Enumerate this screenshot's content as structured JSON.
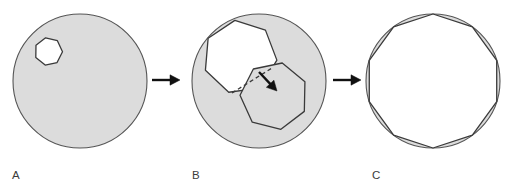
{
  "figure": {
    "background_color": "#ffffff",
    "width": 511,
    "height": 186
  },
  "style": {
    "gray_fill": "#dcdcdc",
    "white_fill": "#ffffff",
    "outline_color": "#555555",
    "polygon_outline_color": "#3a3a3a",
    "arrow_color": "#111111",
    "label_color": "#3b3b3b",
    "dash_color": "#3a3a3a",
    "outline_width": 1.1,
    "polygon_outline_width": 1.3
  },
  "panels": [
    {
      "id": "panel-a",
      "label": "A",
      "label_x": 12,
      "label_y": 179,
      "circle": {
        "cx": 80,
        "cy": 81,
        "r": 67,
        "fill": "#dcdcdc",
        "stroke": "#555555"
      },
      "shapes": [
        {
          "name": "seed-heptagon",
          "kind": "polygon",
          "sides": 7,
          "cx": 48.5,
          "cy": 51.5,
          "r": 14,
          "rotation_deg": -12,
          "fill": "#ffffff",
          "stroke": "#3a3a3a"
        }
      ],
      "arrow_after": {
        "name": "arrow-a-to-b",
        "x1": 152,
        "y1": 80,
        "x2": 180,
        "y2": 80
      }
    },
    {
      "id": "panel-b",
      "label": "B",
      "label_x": 192,
      "label_y": 179,
      "circle": {
        "cx": 259,
        "cy": 81,
        "r": 67,
        "fill": "#dcdcdc",
        "stroke": "#555555"
      },
      "shapes": [
        {
          "name": "grown-heptagon-white",
          "kind": "polygon",
          "sides": 7,
          "cx": 240,
          "cy": 57,
          "r": 37,
          "rotation_deg": -8,
          "fill": "#ffffff",
          "stroke": "#3a3a3a"
        },
        {
          "name": "new-heptagon-gray",
          "kind": "polygon",
          "sides": 7,
          "cx": 274,
          "cy": 96,
          "r": 34,
          "rotation_deg": 14,
          "fill": "#dcdcdc",
          "stroke": "#3a3a3a"
        },
        {
          "name": "growth-direction-dashed-line",
          "kind": "dashed-line",
          "x1": 232,
          "y1": 93,
          "x2": 272,
          "y2": 68,
          "stroke": "#3a3a3a"
        },
        {
          "name": "growth-direction-arrow",
          "kind": "arrowhead",
          "x1": 259,
          "y1": 72,
          "x2": 277,
          "y2": 91,
          "color": "#111111"
        }
      ],
      "arrow_after": {
        "name": "arrow-b-to-c",
        "x1": 333,
        "y1": 80,
        "x2": 361,
        "y2": 80
      }
    },
    {
      "id": "panel-c",
      "label": "C",
      "label_x": 372,
      "label_y": 179,
      "circle": {
        "cx": 433,
        "cy": 81,
        "r": 67,
        "fill": "#dcdcdc",
        "stroke": "#555555"
      },
      "shapes": [
        {
          "name": "final-inscribed-decagon",
          "kind": "polygon",
          "sides": 10,
          "cx": 433,
          "cy": 81,
          "r": 67,
          "rotation_deg": 0,
          "fill": "#ffffff",
          "stroke": "#3a3a3a"
        }
      ],
      "arrow_after": null
    }
  ],
  "arrows": [
    {
      "name": "arrow-a-to-b",
      "x1": 152,
      "y1": 80,
      "x2": 180,
      "y2": 80,
      "color": "#111111"
    },
    {
      "name": "arrow-b-to-c",
      "x1": 333,
      "y1": 80,
      "x2": 361,
      "y2": 80,
      "color": "#111111"
    }
  ]
}
